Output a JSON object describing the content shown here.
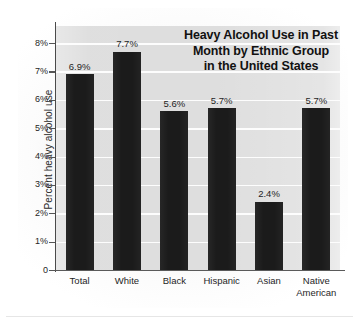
{
  "figure": {
    "title_lines": [
      "Heavy Alcohol Use in Past",
      "Month by Ethnic Group",
      "in the United States"
    ],
    "y_axis_title": "Percent heavy alcohol use"
  },
  "colors": {
    "bar": "#1b1b1b",
    "plot_background": "#dedede",
    "gridline": "#fdfdfd",
    "axis": "#4a4a4a",
    "text": "#1f1f1f"
  },
  "chart_data": {
    "type": "bar",
    "xlabel": "",
    "ylabel": "Percent heavy alcohol use",
    "categories": [
      "Total",
      "White",
      "Black",
      "Hispanic",
      "Asian",
      "Native American"
    ],
    "category_label_lines": [
      [
        "Total"
      ],
      [
        "White"
      ],
      [
        "Black"
      ],
      [
        "Hispanic"
      ],
      [
        "Asian"
      ],
      [
        "Native",
        "American"
      ]
    ],
    "values": [
      6.9,
      7.7,
      5.6,
      5.7,
      2.4,
      5.7
    ],
    "value_labels": [
      "6.9%",
      "7.7%",
      "5.6%",
      "5.7%",
      "2.4%",
      "5.7%"
    ],
    "ylim": [
      0,
      8.6
    ],
    "yticks": [
      0,
      1,
      2,
      3,
      4,
      5,
      6,
      7,
      8
    ],
    "ytick_labels": [
      "0",
      "1%",
      "2%",
      "3%",
      "4%",
      "5%",
      "6%",
      "7%",
      "8%"
    ],
    "grid": true,
    "legend": null
  }
}
